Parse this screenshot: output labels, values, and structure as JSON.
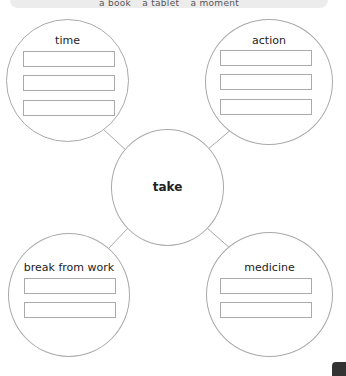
{
  "banner": {
    "words": [
      "a book",
      "a tablet",
      "a moment"
    ]
  },
  "center": {
    "label": "take"
  },
  "nodes": [
    {
      "id": "time",
      "label": "time",
      "boxes": 3
    },
    {
      "id": "action",
      "label": "action",
      "boxes": 3
    },
    {
      "id": "break-from-work",
      "label": "break from work",
      "boxes": 2
    },
    {
      "id": "medicine",
      "label": "medicine",
      "boxes": 2
    }
  ],
  "colors": {
    "stroke": "#a9a9a9",
    "banner_bg": "#ececec",
    "text": "#222222"
  }
}
